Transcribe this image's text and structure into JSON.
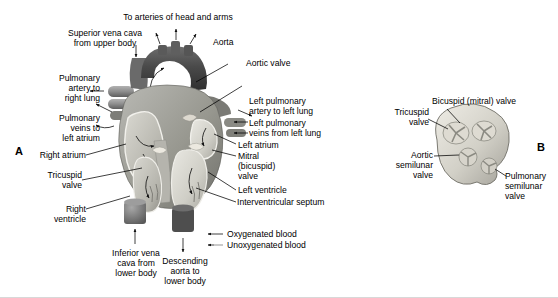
{
  "figure": {
    "panels": [
      {
        "letter": "A",
        "caption": "Coronal section of the heart showing chambers, valves and great vessels"
      },
      {
        "letter": "B",
        "caption": "Superior view of the heart valves"
      }
    ]
  },
  "panel_a": {
    "letter": "A",
    "labels": {
      "to_arteries": "To arteries of head and arms",
      "superior_vena_cava": "Superior vena cava\nfrom upper body",
      "aorta": "Aorta",
      "aortic_valve": "Aortic valve",
      "pulmonary_artery_right": "Pulmonary\nartery to\nright lung",
      "pulmonary_veins_left_atrium": "Pulmonary\nveins to\nleft atrium",
      "left_pulmonary_artery": "Left pulmonary\nartery to left lung",
      "left_pulmonary_veins": "Left pulmonary\nveins from left lung",
      "left_atrium": "Left atrium",
      "mitral_valve": "Mitral\n(bicuspid)\nvalve",
      "left_ventricle": "Left ventricle",
      "interventricular_septum": "Interventricular septum",
      "right_atrium": "Right atrium",
      "tricuspid_valve": "Tricuspid\nvalve",
      "right_ventricle": "Right\nventricle",
      "inferior_vena_cava": "Inferior vena\ncava from\nlower body",
      "descending_aorta": "Descending\naorta to\nlower body"
    }
  },
  "panel_b": {
    "letter": "B",
    "labels": {
      "bicuspid_valve": "Bicuspid (mitral) valve",
      "tricuspid_valve": "Tricuspid\nvalve",
      "aortic_semilunar_valve": "Aortic\nsemilunar\nvalve",
      "pulmonary_semilunar_valve": "Pulmonary\nsemilunar\nvalve"
    }
  },
  "legend": {
    "items": [
      {
        "label": "Oxygenated blood",
        "marker": "solid-left-arrow"
      },
      {
        "label": "Unoxygenated blood",
        "marker": "open-left-arrow"
      }
    ]
  },
  "colors": {
    "ink": "#000000",
    "background": "#ffffff",
    "aorta_dark": "#4a4a4a",
    "myocardium_mid": "#9a9a9a",
    "chamber_light": "#d5d5d0",
    "vessel_gray": "#8d8d8d",
    "valve_light": "#e6e4dd"
  }
}
